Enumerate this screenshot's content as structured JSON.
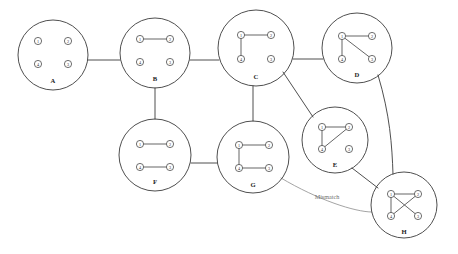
{
  "diagram": {
    "canvas": {
      "width": 458,
      "height": 254
    },
    "colors": {
      "background": "#ffffff",
      "cluster_stroke": "#3b3b3b",
      "node_stroke": "#4a4a4a",
      "node_fill": "#ffffff",
      "edge_stroke": "#4a4a4a",
      "mismatch_stroke": "#8d8d8d",
      "label_text": "#1d1d1d",
      "edge_label_text": "#6f6f6f"
    },
    "node_labels": [
      "1",
      "2",
      "3",
      "4"
    ],
    "clusters": [
      {
        "id": "A",
        "label": "A",
        "cx": 53,
        "cy": 55,
        "r": 35,
        "label_x": 53,
        "label_y": 80,
        "nodes": [
          {
            "name": "1",
            "x": 38,
            "y": 41
          },
          {
            "name": "2",
            "x": 68,
            "y": 41
          },
          {
            "name": "4",
            "x": 38,
            "y": 64
          },
          {
            "name": "3",
            "x": 68,
            "y": 64
          }
        ],
        "edges": []
      },
      {
        "id": "B",
        "label": "B",
        "cx": 155,
        "cy": 53,
        "r": 35,
        "label_x": 155,
        "label_y": 78,
        "nodes": [
          {
            "name": "1",
            "x": 140,
            "y": 39
          },
          {
            "name": "2",
            "x": 170,
            "y": 39
          },
          {
            "name": "4",
            "x": 140,
            "y": 62
          },
          {
            "name": "3",
            "x": 170,
            "y": 62
          }
        ],
        "edges": [
          {
            "from": "1",
            "to": "2"
          }
        ]
      },
      {
        "id": "C",
        "label": "C",
        "cx": 256,
        "cy": 48,
        "r": 38,
        "label_x": 256,
        "label_y": 76,
        "nodes": [
          {
            "name": "1",
            "x": 241,
            "y": 35
          },
          {
            "name": "2",
            "x": 271,
            "y": 35
          },
          {
            "name": "4",
            "x": 241,
            "y": 59
          },
          {
            "name": "3",
            "x": 271,
            "y": 59
          }
        ],
        "edges": [
          {
            "from": "1",
            "to": "2"
          },
          {
            "from": "1",
            "to": "4"
          }
        ]
      },
      {
        "id": "D",
        "label": "D",
        "cx": 357,
        "cy": 48,
        "r": 35,
        "label_x": 357,
        "label_y": 74,
        "nodes": [
          {
            "name": "1",
            "x": 342,
            "y": 36
          },
          {
            "name": "2",
            "x": 372,
            "y": 36
          },
          {
            "name": "4",
            "x": 342,
            "y": 59
          },
          {
            "name": "3",
            "x": 372,
            "y": 59
          }
        ],
        "edges": [
          {
            "from": "1",
            "to": "2"
          },
          {
            "from": "1",
            "to": "4"
          },
          {
            "from": "1",
            "to": "3"
          }
        ]
      },
      {
        "id": "E",
        "label": "E",
        "cx": 335,
        "cy": 140,
        "r": 33,
        "label_x": 335,
        "label_y": 164,
        "nodes": [
          {
            "name": "1",
            "x": 322,
            "y": 127
          },
          {
            "name": "2",
            "x": 349,
            "y": 127
          },
          {
            "name": "4",
            "x": 322,
            "y": 149
          },
          {
            "name": "3",
            "x": 349,
            "y": 149
          }
        ],
        "edges": [
          {
            "from": "1",
            "to": "2"
          },
          {
            "from": "1",
            "to": "4"
          },
          {
            "from": "2",
            "to": "4"
          }
        ]
      },
      {
        "id": "F",
        "label": "F",
        "cx": 155,
        "cy": 155,
        "r": 36,
        "label_x": 155,
        "label_y": 181,
        "nodes": [
          {
            "name": "1",
            "x": 140,
            "y": 144
          },
          {
            "name": "2",
            "x": 170,
            "y": 144
          },
          {
            "name": "4",
            "x": 140,
            "y": 167
          },
          {
            "name": "3",
            "x": 170,
            "y": 167
          }
        ],
        "edges": [
          {
            "from": "1",
            "to": "2"
          },
          {
            "from": "4",
            "to": "3"
          }
        ]
      },
      {
        "id": "G",
        "label": "G",
        "cx": 253,
        "cy": 157,
        "r": 36,
        "label_x": 253,
        "label_y": 184,
        "nodes": [
          {
            "name": "1",
            "x": 239,
            "y": 145
          },
          {
            "name": "2",
            "x": 269,
            "y": 145
          },
          {
            "name": "4",
            "x": 239,
            "y": 168
          },
          {
            "name": "3",
            "x": 269,
            "y": 168
          }
        ],
        "edges": [
          {
            "from": "1",
            "to": "2"
          },
          {
            "from": "1",
            "to": "4"
          },
          {
            "from": "4",
            "to": "3"
          }
        ]
      },
      {
        "id": "H",
        "label": "H",
        "cx": 404,
        "cy": 205,
        "r": 33,
        "label_x": 404,
        "label_y": 231,
        "nodes": [
          {
            "name": "1",
            "x": 391,
            "y": 194
          },
          {
            "name": "2",
            "x": 418,
            "y": 194
          },
          {
            "name": "4",
            "x": 391,
            "y": 216
          },
          {
            "name": "3",
            "x": 418,
            "y": 216
          }
        ],
        "edges": [
          {
            "from": "1",
            "to": "2"
          },
          {
            "from": "1",
            "to": "4"
          },
          {
            "from": "1",
            "to": "3"
          },
          {
            "from": "2",
            "to": "4"
          }
        ]
      }
    ],
    "connections": [
      {
        "id": "A-B",
        "from": "A",
        "to": "B",
        "path": "M 88 60 L 120 60",
        "mismatch": false
      },
      {
        "id": "B-C",
        "from": "B",
        "to": "C",
        "path": "M 190 60 L 219 60",
        "mismatch": false
      },
      {
        "id": "C-D",
        "from": "C",
        "to": "D",
        "path": "M 293 59 L 323 59",
        "mismatch": false
      },
      {
        "id": "B-F",
        "from": "B",
        "to": "F",
        "path": "M 155 88 L 155 119",
        "mismatch": false
      },
      {
        "id": "C-G",
        "from": "C",
        "to": "G",
        "path": "M 253 86 L 253 121",
        "mismatch": false
      },
      {
        "id": "F-G",
        "from": "F",
        "to": "G",
        "path": "M 191 163 L 217 163",
        "mismatch": false
      },
      {
        "id": "C-E",
        "from": "C",
        "to": "E",
        "path": "M 283 72 L 313 117",
        "mismatch": false
      },
      {
        "id": "D-H",
        "from": "D",
        "to": "H",
        "path": "M 378 75 C 390 115, 392 145, 393 174",
        "mismatch": false
      },
      {
        "id": "E-H",
        "from": "E",
        "to": "H",
        "path": "M 352 168 L 378 188",
        "mismatch": false
      },
      {
        "id": "G-H",
        "from": "G",
        "to": "H",
        "path": "M 281 178 C 318 200, 355 212, 372 212",
        "mismatch": true,
        "label": "Mismatch",
        "label_x": 327,
        "label_y": 196
      }
    ]
  }
}
